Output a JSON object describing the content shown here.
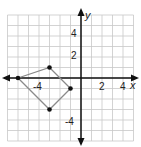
{
  "chart_data": {
    "type": "scatter",
    "title": "",
    "xlabel": "x",
    "ylabel": "y",
    "xlim": [
      -7,
      5
    ],
    "ylim": [
      -6,
      6
    ],
    "grid": true,
    "x_tick_labels": [
      "-4",
      "2",
      "4"
    ],
    "y_tick_labels": [
      "4",
      "2",
      "-4"
    ],
    "polygon": {
      "name": "quadrilateral",
      "vertices": [
        [
          -6,
          0
        ],
        [
          -3,
          1
        ],
        [
          -1,
          -1
        ],
        [
          -3,
          -3
        ]
      ]
    }
  },
  "axes": {
    "x_label": "x",
    "y_label": "y",
    "x_ticks": [
      {
        "value": -4,
        "label": "-4"
      },
      {
        "value": 2,
        "label": "2"
      },
      {
        "value": 4,
        "label": "4"
      }
    ],
    "y_ticks": [
      {
        "value": 4,
        "label": "4"
      },
      {
        "value": 2,
        "label": "2"
      },
      {
        "value": -4,
        "label": "-4"
      }
    ]
  },
  "colors": {
    "grid": "#c8c8c8",
    "axis": "#111111",
    "polygon": "#8a8a8a",
    "point": "#111111"
  }
}
